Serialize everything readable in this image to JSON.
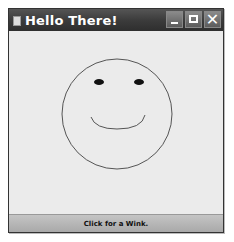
{
  "window": {
    "title": "Hello There!",
    "controls": {
      "minimize": "minimize",
      "maximize": "maximize",
      "close": "✕"
    }
  },
  "canvas": {
    "face": {
      "cx": 108,
      "cy": 83,
      "r": 55,
      "stroke": "#555555",
      "left_eye": {
        "cx": 90,
        "cy": 51,
        "rx": 5,
        "ry": 3
      },
      "right_eye": {
        "cx": 130,
        "cy": 51,
        "rx": 5,
        "ry": 3
      },
      "smile": "M 82 86 Q 86 98 108 98 Q 133 98 136 84"
    }
  },
  "action": {
    "label": "Click for a Wink."
  }
}
